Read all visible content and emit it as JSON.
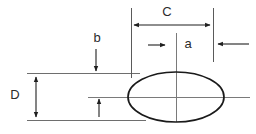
{
  "figure": {
    "type": "engineering-dimension-diagram",
    "background_color": "#ffffff",
    "line_color": "#1a1a1a",
    "thin_line_color": "#6e6e6e",
    "label_color": "#2b2b2b"
  },
  "labels": {
    "c": "C",
    "a": "a",
    "b": "b",
    "d": "D"
  },
  "geometry": {
    "ellipse": {
      "center_x": 176,
      "center_y": 97,
      "radius_x": 48,
      "radius_y": 25
    },
    "extension_lines": [
      {
        "name": "left-extension-line",
        "x": 131,
        "y1": 8,
        "y2": 78
      },
      {
        "name": "right-extension-line",
        "x": 213,
        "y1": 8,
        "y2": 62
      }
    ],
    "horizontal_lines": [
      {
        "name": "upper-reference-line",
        "y": 73,
        "x1": 27,
        "x2": 140
      },
      {
        "name": "center-reference-line",
        "y": 97,
        "x1": 88,
        "x2": 250
      },
      {
        "name": "lower-reference-line",
        "y": 120,
        "x1": 27,
        "x2": 146
      }
    ],
    "vertical_center_line": {
      "x": 176,
      "y1": 33,
      "y2": 122
    },
    "dimensions": [
      {
        "name": "c-dimension",
        "orientation": "horizontal",
        "x1": 133,
        "x2": 211,
        "y": 25,
        "arrows": "both"
      },
      {
        "name": "a-dimension",
        "orientation": "horizontal",
        "x1": 148,
        "x2": 167,
        "y": 45,
        "arrows": "right"
      },
      {
        "name": "a-outer-dimension",
        "orientation": "horizontal",
        "x1": 249,
        "x2": 216,
        "y": 44,
        "arrows": "left"
      },
      {
        "name": "b-dimension",
        "orientation": "vertical",
        "x": 96,
        "y1": 49,
        "y2": 72,
        "arrows": "down"
      },
      {
        "name": "b-lower-dimension",
        "orientation": "vertical",
        "x": 99,
        "y1": 117,
        "y2": 98,
        "arrows": "up"
      },
      {
        "name": "d-dimension",
        "orientation": "vertical",
        "x": 36,
        "y1": 76,
        "y2": 118,
        "arrows": "both"
      }
    ],
    "label_positions": {
      "c": {
        "x": 167,
        "y": 13
      },
      "a": {
        "x": 188,
        "y": 45
      },
      "b": {
        "x": 97,
        "y": 39
      },
      "d": {
        "x": 15,
        "y": 96
      }
    }
  }
}
